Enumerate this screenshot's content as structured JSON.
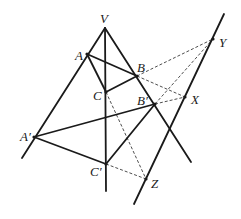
{
  "diagram": {
    "points": {
      "V": {
        "label": "V",
        "x": 105,
        "y": 28
      },
      "A": {
        "label": "A",
        "x": 87,
        "y": 54
      },
      "B": {
        "label": "B",
        "x": 137,
        "y": 76
      },
      "C": {
        "label": "C",
        "x": 106,
        "y": 92
      },
      "A_prime": {
        "label": "A′",
        "x": 34,
        "y": 137
      },
      "B_prime": {
        "label": "B′",
        "x": 155,
        "y": 104
      },
      "C_prime": {
        "label": "C′",
        "x": 106,
        "y": 164
      },
      "X": {
        "label": "X",
        "x": 185,
        "y": 97
      },
      "Y": {
        "label": "Y",
        "x": 213,
        "y": 39
      },
      "Z": {
        "label": "Z",
        "x": 146,
        "y": 179
      }
    },
    "solid_lines": [
      {
        "from": "V",
        "to_xy": [
          22,
          158
        ],
        "desc": "ray V through A and A′"
      },
      {
        "from": "V",
        "to_xy": [
          106,
          191
        ],
        "desc": "ray V through C and C′"
      },
      {
        "from": "V",
        "to_xy": [
          191,
          162
        ],
        "desc": "ray V through B and B′"
      },
      {
        "from": "A",
        "to": "B"
      },
      {
        "from": "B",
        "to": "C"
      },
      {
        "from": "A",
        "to": "C"
      },
      {
        "from": "A_prime",
        "to": "B_prime"
      },
      {
        "from": "B_prime",
        "to": "C_prime"
      },
      {
        "from": "A_prime",
        "to": "C_prime"
      },
      {
        "from_xy": [
          134,
          204
        ],
        "to_xy": [
          224,
          14
        ],
        "desc": "axis line through Z, X, Y"
      }
    ],
    "dashed_lines": [
      {
        "from": "B",
        "to": "Y"
      },
      {
        "from": "B_prime",
        "to": "Y"
      },
      {
        "from": "B",
        "to": "X"
      },
      {
        "from": "B_prime",
        "to": "X"
      },
      {
        "from": "C",
        "to": "Z"
      },
      {
        "from": "C_prime",
        "to": "Z"
      }
    ]
  }
}
